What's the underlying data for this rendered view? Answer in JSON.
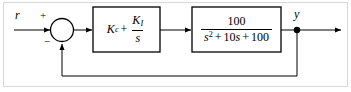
{
  "diagram": {
    "type": "control-system-block-diagram",
    "width": 351,
    "height": 92,
    "line_color": "#000000",
    "border_color": "#d8d8d8",
    "background": "#ffffff"
  },
  "signals": {
    "input_label": "r",
    "output_label": "y",
    "sum_plus": "+",
    "sum_minus": "−"
  },
  "blocks": {
    "controller": {
      "name": "PI controller",
      "gain_symbol": "K",
      "gain_subscript": "c",
      "plus_operator": "+",
      "integral_numerator_symbol": "K",
      "integral_numerator_subscript": "I",
      "integral_denominator": "s"
    },
    "plant": {
      "name": "Plant transfer function",
      "numerator": "100",
      "den_var": "s",
      "den_exponent": "2",
      "den_term2_op": "+",
      "den_term2": "10",
      "den_term2_var": "s",
      "den_term3_op": "+",
      "den_term3": "100"
    }
  },
  "connections": {
    "input_arrow": "r-to-summing-junction",
    "sum_to_controller": "summing-junction-to-controller",
    "controller_to_plant": "controller-to-plant",
    "plant_to_output": "plant-to-output-node",
    "output_arrow": "output-node-to-terminal",
    "feedback_path": "output-node-to-summing-junction"
  }
}
